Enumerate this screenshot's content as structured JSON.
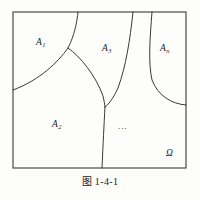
{
  "figure": {
    "caption": "图 1-4-1",
    "universe_label": "Ω",
    "ellipsis": "...",
    "regions": [
      {
        "name": "A1",
        "base": "A",
        "sub": "1",
        "x": 36,
        "y": 38
      },
      {
        "name": "A2",
        "base": "A",
        "sub": "2",
        "x": 52,
        "y": 120
      },
      {
        "name": "A3",
        "base": "A",
        "sub": "3",
        "x": 102,
        "y": 44
      },
      {
        "name": "An",
        "base": "A",
        "sub": "n",
        "x": 160,
        "y": 44
      }
    ],
    "frame": {
      "left": 13,
      "top": 12,
      "right": 186,
      "bottom": 168,
      "stroke": "#3a3a3a",
      "stroke_width": 1.1
    },
    "curve_stroke": "#2e2e2e",
    "curve_stroke_width": 0.95,
    "background": "#fdfdfc",
    "curves": [
      {
        "id": "arc-a1-boundary",
        "desc": "boundary of A1 from top edge to left edge",
        "d": "M 78 12 C 76 32 70 44 68 48 C 58 62 40 80 13 90"
      },
      {
        "id": "curve-a1-a2-a3",
        "desc": "from triple junction down to lower triple junction",
        "d": "M 68 48 C 80 56 96 76 103 96 C 104 101 105 105 105 107"
      },
      {
        "id": "curve-a3-top-to-junction",
        "desc": "from top edge down to lower triple junction",
        "d": "M 133 12 C 130 40 126 66 118 88 C 113 99 108 105 105 107"
      },
      {
        "id": "curve-bottom-stem",
        "desc": "from lower triple junction down to bottom edge",
        "d": "M 105 107 C 104 124 103 146 102 168"
      },
      {
        "id": "curve-an-left",
        "desc": "right region left boundary from top edge to right edge",
        "d": "M 152 12 C 150 38 148 62 152 80 C 158 96 172 104 186 105"
      }
    ]
  }
}
